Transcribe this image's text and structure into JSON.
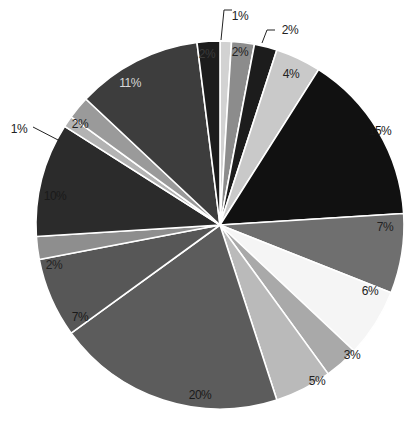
{
  "chart_data": {
    "type": "pie",
    "title": "",
    "start_angle_deg": 0,
    "direction": "clockwise",
    "slices": [
      {
        "label": "1%",
        "value": 1,
        "color": "#d2d2d2",
        "label_color": "#222222",
        "callout": true
      },
      {
        "label": "2%",
        "value": 2,
        "color": "#8c8c8c",
        "label_color": "#222222"
      },
      {
        "label": "2%",
        "value": 2,
        "color": "#1c1c1c",
        "label_color": "#222222",
        "callout": true
      },
      {
        "label": "4%",
        "value": 4,
        "color": "#c9c9c9",
        "label_color": "#222222"
      },
      {
        "label": "15%",
        "value": 15,
        "color": "#111111",
        "label_color": "#151515"
      },
      {
        "label": "7%",
        "value": 7,
        "color": "#6f6f6f",
        "label_color": "#222222"
      },
      {
        "label": "6%",
        "value": 6,
        "color": "#f5f5f5",
        "label_color": "#222222"
      },
      {
        "label": "3%",
        "value": 3,
        "color": "#a9a9a9",
        "label_color": "#222222"
      },
      {
        "label": "5%",
        "value": 5,
        "color": "#bababa",
        "label_color": "#222222"
      },
      {
        "label": "20%",
        "value": 20,
        "color": "#5c5c5c",
        "label_color": "#1a1a1a"
      },
      {
        "label": "7%",
        "value": 7,
        "color": "#575757",
        "label_color": "#1a1a1a"
      },
      {
        "label": "2%",
        "value": 2,
        "color": "#8e8e8e",
        "label_color": "#222222"
      },
      {
        "label": "10%",
        "value": 10,
        "color": "#2b2b2b",
        "label_color": "#1a1a1a"
      },
      {
        "label": "1%",
        "value": 1,
        "color": "#b3b3b3",
        "label_color": "#222222",
        "callout": true
      },
      {
        "label": "2%",
        "value": 2,
        "color": "#9a9a9a",
        "label_color": "#222222"
      },
      {
        "label": "11%",
        "value": 11,
        "color": "#3d3d3d",
        "label_color": "#d8d8d8"
      },
      {
        "label": "2%",
        "value": 2,
        "color": "#1c1c1c",
        "label_color": "#3a3a3a"
      }
    ],
    "legend": null,
    "center": [
      220,
      225
    ],
    "radius": 184
  }
}
